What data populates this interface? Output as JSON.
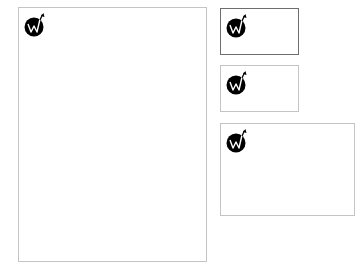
{
  "colors": {
    "page_background": "#ffffff",
    "card_background": "#ffffff",
    "card_border": "#c4c4c4",
    "card_border_selected": "#6e6e6e",
    "logo_fill": "#000000",
    "logo_mark": "#ffffff"
  },
  "logo": {
    "icon": "w-growth-arrow-logo"
  },
  "cards": [
    {
      "id": "large-portrait",
      "size": "large",
      "selected": false,
      "logo_icon": "w-growth-arrow-logo"
    },
    {
      "id": "small-landscape-1",
      "size": "small",
      "selected": true,
      "logo_icon": "w-growth-arrow-logo"
    },
    {
      "id": "small-landscape-2",
      "size": "small",
      "selected": false,
      "logo_icon": "w-growth-arrow-logo"
    },
    {
      "id": "medium-landscape",
      "size": "medium",
      "selected": false,
      "logo_icon": "w-growth-arrow-logo"
    }
  ]
}
